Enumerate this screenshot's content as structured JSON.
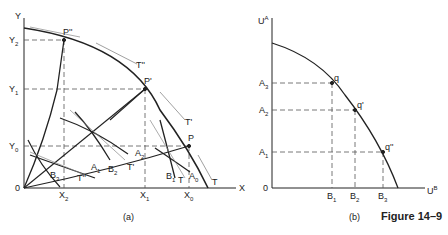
{
  "figure_title": "Figure 14–9",
  "panel_a": {
    "caption": "(a)",
    "y_axis_label": "Y",
    "x_axis_label": "X",
    "origin_label": "0",
    "y_ticks": [
      "Y2",
      "Y1",
      "Y0"
    ],
    "x_ticks": [
      "X2",
      "X1",
      "X0"
    ],
    "points": [
      "P''",
      "P'",
      "P"
    ],
    "tangent_labels": [
      "T''",
      "T'",
      "T",
      "T",
      "T'",
      "T''"
    ],
    "isoquant_labels": [
      "A1",
      "A2",
      "A3",
      "B1",
      "B2",
      "B3"
    ]
  },
  "panel_b": {
    "caption": "(b)",
    "y_axis_label": "UA",
    "x_axis_label": "UB",
    "origin_label": "0",
    "y_ticks": [
      "A3",
      "A2",
      "A1"
    ],
    "x_ticks": [
      "B1",
      "B2",
      "B3"
    ],
    "points": [
      "q",
      "q'",
      "q''"
    ]
  },
  "labels": {
    "Y": "Y",
    "Y2": "Y",
    "Y1": "Y",
    "Y0": "Y",
    "s2": "2",
    "s1": "1",
    "s0": "0",
    "X": "X",
    "O": "0",
    "P2": "P''",
    "P1": "P'",
    "P0": "P",
    "T2": "T''",
    "T1": "T'",
    "T0": "T",
    "A": "A",
    "B": "B",
    "T": "T",
    "UA": "U",
    "UB": "U",
    "sA": "A",
    "sB": "B",
    "q0": "q",
    "q1": "q'",
    "q2": "q''"
  }
}
